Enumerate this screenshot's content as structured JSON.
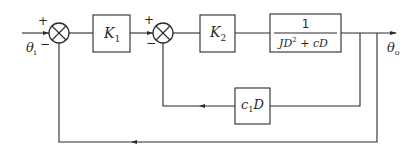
{
  "diagram": {
    "type": "control-system-block-diagram",
    "input": {
      "symbol": "θ",
      "subscript": "i"
    },
    "output": {
      "symbol": "θ",
      "subscript": "o"
    },
    "summing_junctions": [
      {
        "id": "sum1",
        "plus": "+",
        "minus": "−"
      },
      {
        "id": "sum2",
        "plus": "+",
        "minus": "−"
      }
    ],
    "blocks": {
      "k1": {
        "symbol": "K",
        "subscript": "1"
      },
      "k2": {
        "symbol": "K",
        "subscript": "2"
      },
      "plant": {
        "numerator": "1",
        "denominator_a": "JD",
        "denominator_exp": "2",
        "denominator_b": " + cD"
      },
      "feedback": {
        "symbol": "c",
        "subscript": "1",
        "suffix": "D"
      }
    },
    "colors": {
      "stroke": "#2a2a2a",
      "background": "#ffffff"
    }
  }
}
